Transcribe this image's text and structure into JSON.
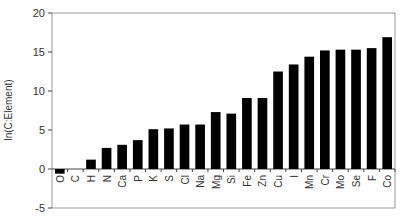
{
  "chart_data": {
    "type": "bar",
    "title": "",
    "xlabel": "",
    "ylabel": "ln(C:Element)",
    "ylim": [
      -5,
      20
    ],
    "yticks": [
      -5,
      0,
      5,
      10,
      15,
      20
    ],
    "grid": false,
    "legend": null,
    "bar_color": "#000000",
    "categories": [
      "O",
      "C",
      "H",
      "N",
      "Ca",
      "P",
      "K",
      "S",
      "Cl",
      "Na",
      "Mg",
      "Si",
      "Fe",
      "Zn",
      "Cu",
      "I",
      "Mn",
      "Cr",
      "Mo",
      "Se",
      "F",
      "Co"
    ],
    "values": [
      -0.6,
      0,
      1.2,
      2.7,
      3.1,
      3.7,
      5.1,
      5.2,
      5.7,
      5.7,
      7.3,
      7.1,
      9.1,
      9.1,
      12.5,
      13.4,
      14.4,
      15.2,
      15.3,
      15.3,
      15.5,
      16.9
    ]
  }
}
